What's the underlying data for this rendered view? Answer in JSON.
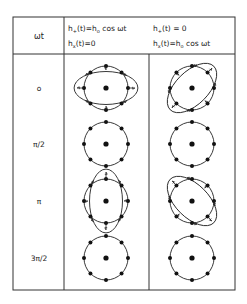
{
  "table": {
    "header": {
      "col0": "ωt",
      "col1": {
        "line1": {
          "h": "h",
          "sub": "+",
          "rest": "(t)=h",
          "sub2": "o",
          "tail": " cos ωt"
        },
        "line2": {
          "h": "h",
          "sub": "x",
          "rest": "(t)=0"
        }
      },
      "col2": {
        "line1": {
          "h": "h",
          "sub": "+",
          "rest": "(t) = 0"
        },
        "line2": {
          "h": "h",
          "sub": "x",
          "rest": "(t)=h",
          "sub2": "o",
          "tail": " cos ωt"
        }
      }
    },
    "rows": [
      {
        "phase": "o",
        "plus": "horizontal",
        "cross": "diag-up"
      },
      {
        "phase": "π/2",
        "plus": "circle",
        "cross": "circle"
      },
      {
        "phase": "π",
        "plus": "vertical",
        "cross": "diag-down"
      },
      {
        "phase": "3π/2",
        "plus": "circle",
        "cross": "circle"
      }
    ]
  },
  "colors": {
    "line": "#222222",
    "dot": "#111111"
  }
}
